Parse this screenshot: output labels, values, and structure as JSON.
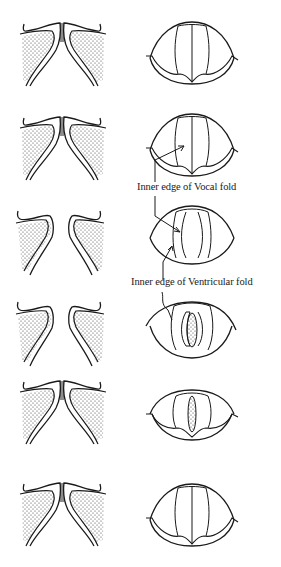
{
  "diagram": {
    "type": "anatomical-sequence",
    "columns": [
      "coronal-section",
      "laryngoscopic-view"
    ],
    "rows": [
      {
        "index": 1,
        "section_state": "folds-approximated",
        "view_state": "closed"
      },
      {
        "index": 2,
        "section_state": "folds-beginning-to-part-below",
        "view_state": "closed",
        "annotation": "Inner edge of Vocal fold"
      },
      {
        "index": 3,
        "section_state": "folds-separated",
        "view_state": "opening",
        "annotation": "Inner edge of Ventricular fold"
      },
      {
        "index": 4,
        "section_state": "folds-separated",
        "view_state": "open-glottis"
      },
      {
        "index": 5,
        "section_state": "folds-closing",
        "view_state": "narrow-glottis"
      },
      {
        "index": 6,
        "section_state": "folds-approximated",
        "view_state": "closed"
      }
    ]
  },
  "labels": {
    "vocal_fold": "Inner edge of Vocal fold",
    "ventricular_fold": "Inner edge of Ventricular fold"
  },
  "colors": {
    "ink": "#1a1a1a",
    "background": "#ffffff"
  }
}
